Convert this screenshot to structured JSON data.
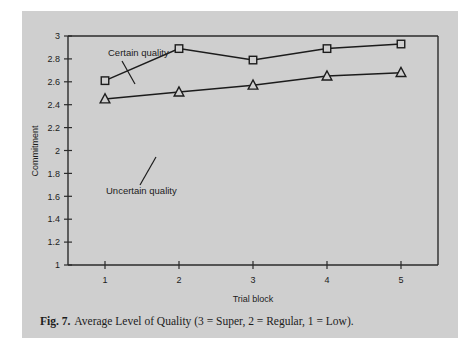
{
  "figure": {
    "caption_label": "Fig. 7.",
    "caption_text": "Average Level of Quality (3 = Super, 2 = Regular, 1 = Low).",
    "panel_color": "#cfcfcf",
    "ink_color": "#1c1c1c"
  },
  "chart_data": {
    "type": "line",
    "title": "",
    "subtitle": "",
    "xlabel": "Trial block",
    "ylabel": "Commitment",
    "categories": [
      "1",
      "2",
      "3",
      "4",
      "5"
    ],
    "x": [
      1,
      2,
      3,
      4,
      5
    ],
    "xlim": [
      0.5,
      5.5
    ],
    "ylim": [
      1,
      3
    ],
    "yticks": [
      "1",
      "1.2",
      "1.4",
      "1.6",
      "1.8",
      "2",
      "2.2",
      "2.4",
      "2.6",
      "2.8",
      "3"
    ],
    "ytick_values": [
      1,
      1.2,
      1.4,
      1.6,
      1.8,
      2,
      2.2,
      2.4,
      2.6,
      2.8,
      3
    ],
    "xticks": [
      "1",
      "2",
      "3",
      "4",
      "5"
    ],
    "grid": false,
    "legend_position": "inline-annotations",
    "series": [
      {
        "name": "Certain quality",
        "marker": "square",
        "values": [
          2.61,
          2.89,
          2.79,
          2.89,
          2.93
        ]
      },
      {
        "name": "Uncertain quality",
        "marker": "triangle",
        "values": [
          2.45,
          2.51,
          2.57,
          2.65,
          2.68
        ]
      }
    ],
    "annotations": [
      {
        "text": "Certain quality",
        "points_to_series": "Certain quality",
        "points_to_index": 0
      },
      {
        "text": "Uncertain quality",
        "points_to_series": "Uncertain quality",
        "points_to_index": 0
      }
    ]
  }
}
